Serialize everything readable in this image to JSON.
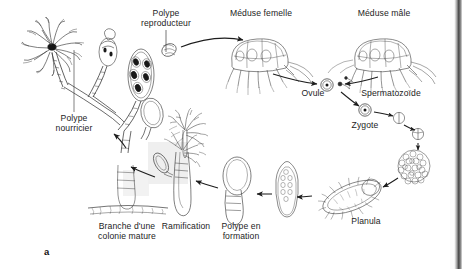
{
  "figure": {
    "panel_marker": "a",
    "language": "fr"
  },
  "labels": {
    "polype_reproducteur": "Polype\nreproducteur",
    "meduse_femelle": "Méduse femelle",
    "meduse_male": "Méduse mâle",
    "ovule": "Ovule",
    "spermatozoide": "Spermatozoïde",
    "zygote": "Zygote",
    "planula": "Planula",
    "polype_nourricier": "Polype\nnourricier",
    "branche_colonie": "Branche d'une\ncolonie mature",
    "ramification": "Ramification",
    "polype_en_formation": "Polype en\nformation"
  },
  "stages": [
    {
      "id": "polype-nourricier",
      "label": "Polype nourricier",
      "order": 1
    },
    {
      "id": "polype-reproducteur",
      "label": "Polype reproducteur",
      "order": 2
    },
    {
      "id": "meduse-femelle",
      "label": "Méduse femelle",
      "order": 3
    },
    {
      "id": "meduse-male",
      "label": "Méduse mâle",
      "order": 4
    },
    {
      "id": "ovule",
      "label": "Ovule",
      "order": 5
    },
    {
      "id": "spermatozoide",
      "label": "Spermatozoïde",
      "order": 6
    },
    {
      "id": "zygote",
      "label": "Zygote",
      "order": 7
    },
    {
      "id": "clivage-2-cellules",
      "label": "",
      "order": 8
    },
    {
      "id": "clivage-4-cellules",
      "label": "",
      "order": 9
    },
    {
      "id": "morula",
      "label": "",
      "order": 10
    },
    {
      "id": "planula",
      "label": "Planula",
      "order": 11
    },
    {
      "id": "planula-fixee",
      "label": "",
      "order": 12
    },
    {
      "id": "polype-en-formation",
      "label": "Polype en formation",
      "order": 13
    },
    {
      "id": "ramification",
      "label": "Ramification",
      "order": 14
    },
    {
      "id": "branche-colonie-mature",
      "label": "Branche d'une colonie mature",
      "order": 15
    }
  ],
  "colors": {
    "ink": "#1d1d1d",
    "line": "#2b2b2b",
    "background": "#ffffff",
    "shade": "#ececec",
    "scan_edge": "#3a3a3a"
  }
}
